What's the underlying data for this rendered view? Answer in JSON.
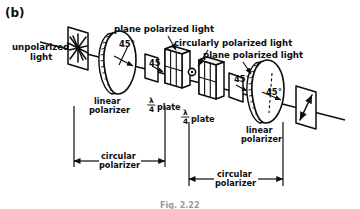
{
  "figure": {
    "panel_label": "(b)",
    "caption": "Fig. 2.22",
    "background_color": "#ffffff",
    "ink_color": "#0d0d0d"
  },
  "beam_labels": {
    "input_line1": "unpolarized",
    "input_line2": "light",
    "plane_polarized_1": "plane polarized light",
    "circularly_polarized": "circularly polarized light",
    "plane_polarized_2": "plane polarized light"
  },
  "components": [
    {
      "id": "aperture-1",
      "label": "",
      "kind": "aperture-plate",
      "note": "entry plate showing unpolarized starburst symbol"
    },
    {
      "id": "linear-polarizer-1",
      "label_line1": "linear",
      "label_line2": "polarizer",
      "angle": "45°",
      "kind": "disc"
    },
    {
      "id": "quarter-wave-plate-1",
      "label_numerator": "λ",
      "label_denominator": "4",
      "label_suffix": "plate",
      "angle": "45",
      "kind": "slab"
    },
    {
      "id": "quarter-wave-plate-2",
      "label_numerator": "λ",
      "label_denominator": "4",
      "label_suffix": "plate",
      "angle": "45°",
      "kind": "slab"
    },
    {
      "id": "linear-polarizer-2",
      "label_line1": "linear",
      "label_line2": "polarizer",
      "angle": "45°",
      "kind": "disc"
    },
    {
      "id": "output-plate",
      "label": "",
      "kind": "aperture-plate",
      "note": "exit plate showing plane polarized double arrow"
    }
  ],
  "brackets": [
    {
      "id": "circular-polarizer-left",
      "line1": "circular",
      "line2": "polarizer"
    },
    {
      "id": "circular-polarizer-right",
      "line1": "circular",
      "line2": "polarizer"
    }
  ],
  "angles": {
    "polarizer1": "45°",
    "waveplate1": "45",
    "waveplate2": "45°",
    "polarizer2": "45°"
  }
}
